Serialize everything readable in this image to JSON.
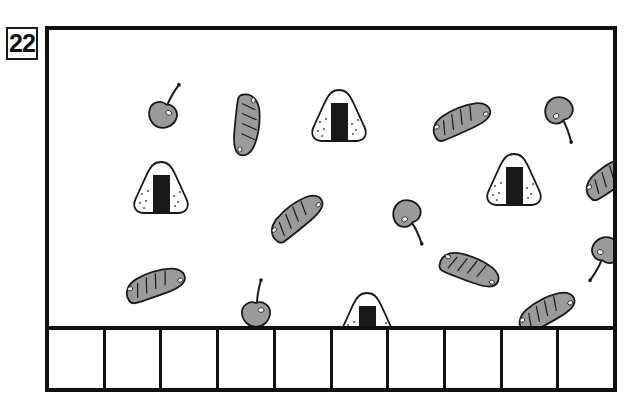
{
  "worksheet": {
    "page_number": "22",
    "frame": {
      "border_color": "#111111"
    },
    "palette": {
      "outline": "#1a1a1a",
      "fill_gray": "#9a9a9a",
      "fill_light": "#b5b5b5",
      "nori_black": "#1a1a1a",
      "rice_white": "#ffffff",
      "page_background": "#ffffff"
    },
    "answer_row": {
      "cell_count": 10,
      "cells": [
        "",
        "",
        "",
        "",
        "",
        "",
        "",
        "",
        "",
        ""
      ]
    },
    "items": [
      {
        "id": 1,
        "kind": "cherry",
        "label": "cherry",
        "x": 114,
        "y": 84,
        "rotation": 20,
        "scale": 1.0
      },
      {
        "id": 2,
        "kind": "sausage",
        "label": "sausage",
        "x": 198,
        "y": 95,
        "rotation": 95,
        "scale": 1.0
      },
      {
        "id": 3,
        "kind": "onigiri",
        "label": "onigiri",
        "x": 290,
        "y": 86,
        "rotation": 0,
        "scale": 1.0
      },
      {
        "id": 4,
        "kind": "sausage",
        "label": "sausage",
        "x": 412,
        "y": 90,
        "rotation": -25,
        "scale": 1.0
      },
      {
        "id": 5,
        "kind": "cherry",
        "label": "cherry",
        "x": 510,
        "y": 81,
        "rotation": 150,
        "scale": 1.0
      },
      {
        "id": 6,
        "kind": "onigiri",
        "label": "onigiri",
        "x": 112,
        "y": 158,
        "rotation": 0,
        "scale": 1.0
      },
      {
        "id": 7,
        "kind": "onigiri",
        "label": "onigiri",
        "x": 465,
        "y": 150,
        "rotation": 0,
        "scale": 1.0
      },
      {
        "id": 8,
        "kind": "sausage",
        "label": "sausage",
        "x": 563,
        "y": 146,
        "rotation": -35,
        "scale": 1.0
      },
      {
        "id": 9,
        "kind": "sausage",
        "label": "sausage",
        "x": 247,
        "y": 187,
        "rotation": -40,
        "scale": 1.0
      },
      {
        "id": 10,
        "kind": "cherry",
        "label": "cherry",
        "x": 358,
        "y": 184,
        "rotation": 145,
        "scale": 1.0
      },
      {
        "id": 11,
        "kind": "cherry",
        "label": "cherry",
        "x": 557,
        "y": 221,
        "rotation": 200,
        "scale": 1.0
      },
      {
        "id": 12,
        "kind": "sausage",
        "label": "sausage",
        "x": 421,
        "y": 239,
        "rotation": 20,
        "scale": 1.0
      },
      {
        "id": 13,
        "kind": "sausage",
        "label": "sausage",
        "x": 106,
        "y": 254,
        "rotation": -20,
        "scale": 1.0
      },
      {
        "id": 14,
        "kind": "cherry",
        "label": "cherry",
        "x": 207,
        "y": 283,
        "rotation": 0,
        "scale": 1.0
      },
      {
        "id": 15,
        "kind": "onigiri",
        "label": "onigiri",
        "x": 318,
        "y": 289,
        "rotation": 0,
        "scale": 1.0
      },
      {
        "id": 16,
        "kind": "sausage",
        "label": "sausage",
        "x": 497,
        "y": 281,
        "rotation": -30,
        "scale": 1.0
      }
    ],
    "counts": {
      "onigiri": 4,
      "sausage": 7,
      "cherry": 5,
      "total": 16
    }
  }
}
